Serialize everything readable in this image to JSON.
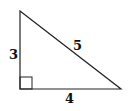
{
  "diagram": {
    "type": "right-triangle",
    "sides": {
      "vertical": "3",
      "horizontal": "4",
      "hypotenuse": "5"
    },
    "right_angle_marker": true,
    "colors": {
      "stroke": "#222222",
      "background": "#ffffff"
    }
  }
}
